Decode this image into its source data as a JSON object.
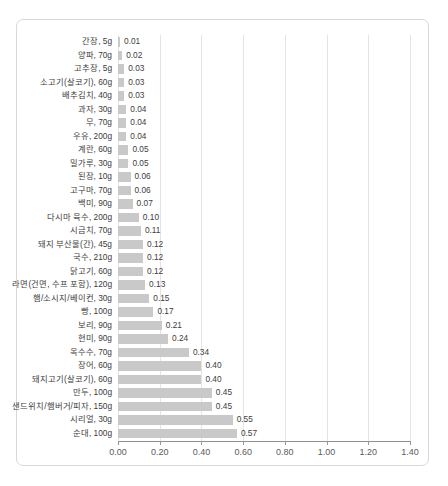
{
  "chart_data": {
    "type": "bar",
    "orientation": "horizontal",
    "title": "",
    "subtitle": "",
    "xlabel": "",
    "ylabel": "",
    "xlim": [
      0.0,
      1.4
    ],
    "xticks": [
      0.0,
      0.2,
      0.4,
      0.6,
      0.8,
      1.0,
      1.2,
      1.4
    ],
    "xtick_labels": [
      "0.00",
      "0.20",
      "0.40",
      "0.60",
      "0.80",
      "1.00",
      "1.20",
      "1.40"
    ],
    "grid": true,
    "legend": null,
    "bar_color": "#c9c9c9",
    "value_label_format": "0.00",
    "categories": [
      "간장, 5g",
      "양파, 70g",
      "고추장, 5g",
      "소고기(살코기), 60g",
      "배추김치, 40g",
      "과자, 30g",
      "무, 70g",
      "우유, 200g",
      "계란, 60g",
      "밀가루, 30g",
      "된장, 10g",
      "고구마, 70g",
      "백미, 90g",
      "다시마 육수, 200g",
      "시금치, 70g",
      "돼지 부산물(간), 45g",
      "국수, 210g",
      "닭고기, 60g",
      "라면(건면, 수프 포함), 120g",
      "햄/소시지/베이컨, 30g",
      "빵, 100g",
      "보리, 90g",
      "현미, 90g",
      "옥수수, 70g",
      "장어, 60g",
      "돼지고기(살코기), 60g",
      "만두, 100g",
      "샌드위치/햄버거/피자, 150g",
      "시리얼, 30g",
      "순대, 100g"
    ],
    "values": [
      0.01,
      0.02,
      0.03,
      0.03,
      0.03,
      0.04,
      0.04,
      0.04,
      0.05,
      0.05,
      0.06,
      0.06,
      0.07,
      0.1,
      0.11,
      0.12,
      0.12,
      0.12,
      0.13,
      0.15,
      0.17,
      0.21,
      0.24,
      0.34,
      0.4,
      0.4,
      0.45,
      0.45,
      0.55,
      0.57
    ],
    "value_labels": [
      "0.01",
      "0.02",
      "0.03",
      "0.03",
      "0.03",
      "0.04",
      "0.04",
      "0.04",
      "0.05",
      "0.05",
      "0.06",
      "0.06",
      "0.07",
      "0.10",
      "0.11",
      "0.12",
      "0.12",
      "0.12",
      "0.13",
      "0.15",
      "0.17",
      "0.21",
      "0.24",
      "0.34",
      "0.40",
      "0.40",
      "0.45",
      "0.45",
      "0.55",
      "0.57"
    ]
  }
}
